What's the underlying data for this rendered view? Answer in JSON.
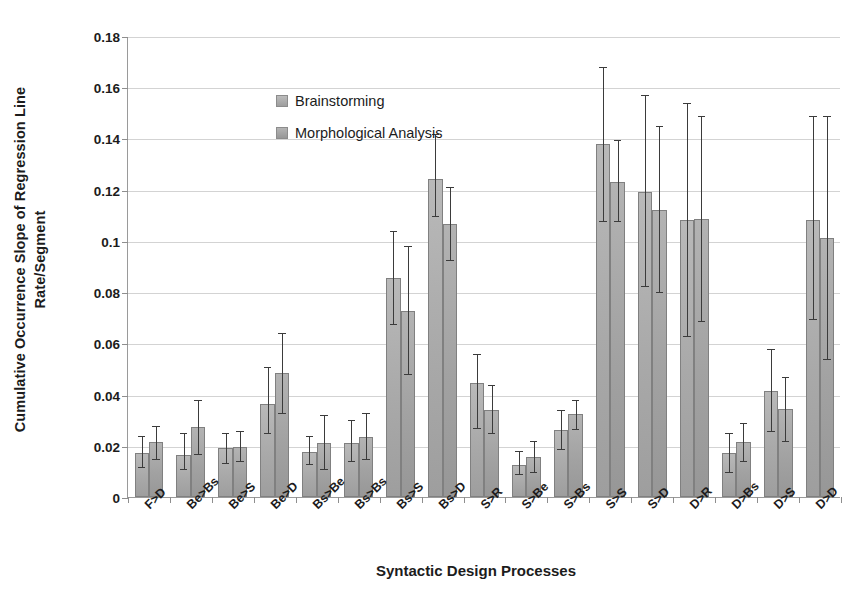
{
  "chart_data": {
    "type": "bar",
    "title": "",
    "xlabel": "Syntactic Design Processes",
    "ylabel_line1": "Cumulative Occurrence Slope of Regression Line",
    "ylabel_line2": "Rate/Segment",
    "ylim": [
      0,
      0.18
    ],
    "ytick_values": [
      0,
      0.02,
      0.04,
      0.06,
      0.08,
      0.1,
      0.12,
      0.14,
      0.16,
      0.18
    ],
    "ytick_labels": [
      "0",
      "0.02",
      "0.04",
      "0.06",
      "0.08",
      "0.1",
      "0.12",
      "0.14",
      "0.16",
      "0.18"
    ],
    "grid": "horizontal",
    "legend_position": "inside-top-left",
    "categories": [
      "F>D",
      "Be>Bs",
      "Be>S",
      "Be>D",
      "Bs>Be",
      "Bs>Bs",
      "Bs>S",
      "Bs>D",
      "S>R",
      "S>Be",
      "S>Bs",
      "S>S",
      "S>D",
      "D>R",
      "D>Bs",
      "D>S",
      "D>D"
    ],
    "series": [
      {
        "name": "Brainstorming",
        "color": "#a9a9a9",
        "values": [
          0.017,
          0.0165,
          0.019,
          0.0365,
          0.0175,
          0.021,
          0.0855,
          0.124,
          0.0445,
          0.0125,
          0.026,
          0.138,
          0.119,
          0.108,
          0.017,
          0.0415,
          0.108
        ],
        "err_low": [
          0.0115,
          0.0105,
          0.013,
          0.0245,
          0.0125,
          0.0135,
          0.067,
          0.1095,
          0.0265,
          0.0085,
          0.0185,
          0.1075,
          0.082,
          0.0625,
          0.0095,
          0.0255,
          0.069
        ],
        "err_high": [
          0.0235,
          0.0245,
          0.0245,
          0.0505,
          0.0235,
          0.0295,
          0.1035,
          0.1415,
          0.0555,
          0.0175,
          0.0335,
          0.1675,
          0.1565,
          0.1535,
          0.0245,
          0.0575,
          0.1485
        ]
      },
      {
        "name": "Morphological Analysis",
        "color": "#a2a2a2",
        "values": [
          0.0215,
          0.0275,
          0.0195,
          0.0485,
          0.021,
          0.0235,
          0.0725,
          0.1065,
          0.034,
          0.0155,
          0.0325,
          0.123,
          0.112,
          0.1085,
          0.0215,
          0.0345,
          0.101
        ],
        "err_low": [
          0.0145,
          0.0165,
          0.0135,
          0.0325,
          0.0105,
          0.0145,
          0.0475,
          0.092,
          0.0245,
          0.0095,
          0.026,
          0.1075,
          0.0795,
          0.0685,
          0.0135,
          0.0215,
          0.0535
        ],
        "err_high": [
          0.0275,
          0.0375,
          0.0255,
          0.0635,
          0.0315,
          0.0325,
          0.0975,
          0.1205,
          0.0435,
          0.0215,
          0.0375,
          0.139,
          0.1445,
          0.1485,
          0.0285,
          0.0465,
          0.1485
        ]
      }
    ]
  },
  "legend": {
    "items": [
      {
        "label": "Brainstorming",
        "swatch": "legend-swatch-brainstorming"
      },
      {
        "label": "Morphological Analysis",
        "swatch": "legend-swatch-morphological-analysis"
      }
    ]
  }
}
